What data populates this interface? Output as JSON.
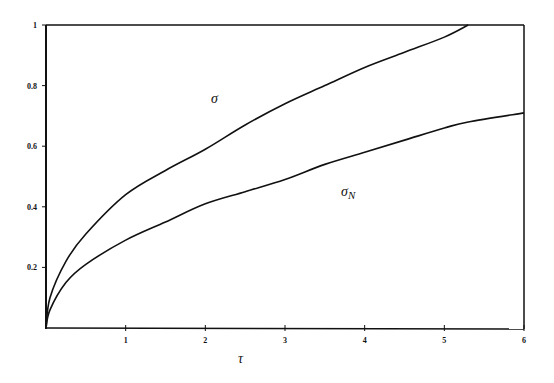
{
  "chart_data": {
    "type": "line",
    "title": "",
    "xlabel": "τ",
    "ylabel": "",
    "xlim": [
      0,
      6
    ],
    "ylim": [
      0,
      1
    ],
    "grid": false,
    "legend": "inline labels",
    "x_ticks": [
      "1",
      "2",
      "3",
      "4",
      "5",
      "6"
    ],
    "y_ticks": [
      "0.2",
      "0.4",
      "0.6",
      "0.8",
      "1"
    ],
    "x": [
      0,
      0.05,
      0.25,
      0.5,
      1,
      1.5,
      2,
      2.5,
      3,
      3.5,
      4,
      4.5,
      5,
      5.3,
      6
    ],
    "series": [
      {
        "name": "σ",
        "values": [
          0,
          0.1,
          0.22,
          0.31,
          0.44,
          0.52,
          0.59,
          0.67,
          0.74,
          0.8,
          0.86,
          0.91,
          0.96,
          1.0,
          null
        ]
      },
      {
        "name": "σN",
        "values": [
          0,
          0.06,
          0.15,
          0.21,
          0.29,
          0.35,
          0.41,
          0.45,
          0.49,
          0.54,
          0.58,
          0.62,
          0.66,
          0.68,
          0.71
        ]
      }
    ],
    "annotations": [
      {
        "text": "σ",
        "x": 2.1,
        "y": 0.76
      },
      {
        "text": "σ",
        "sub": "N",
        "x": 3.8,
        "y": 0.45
      }
    ]
  }
}
